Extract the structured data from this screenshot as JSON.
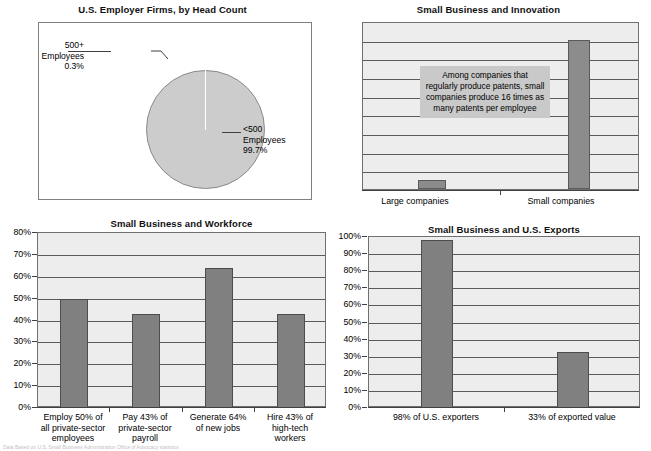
{
  "figure": {
    "footnote": "Data Based on U.S. Small Business Administration Office of Advocacy statistics"
  },
  "chart_data": [
    {
      "type": "pie",
      "id": "employer-firms-pie",
      "title": "U.S. Employer Firms, by Head Count",
      "labels": [
        "<500 Employees",
        "500+ Employees"
      ],
      "values": [
        99.7,
        0.3
      ],
      "value_labels": [
        "99.7%",
        "0.3%"
      ],
      "annotations": [
        {
          "name": "large-firms",
          "line1": "500+",
          "line2": "Employees",
          "line3": "0.3%"
        },
        {
          "name": "small-firms",
          "line1": "<500",
          "line2": "Employees",
          "line3": "99.7%"
        }
      ],
      "slice_color": "#cccccc",
      "legend": "none"
    },
    {
      "type": "bar",
      "id": "innovation-bar",
      "title": "Small Business and Innovation",
      "categories": [
        "Large companies",
        "Small companies"
      ],
      "values": [
        1,
        16
      ],
      "ylim": [
        0,
        18
      ],
      "xlabel": "",
      "ylabel": "",
      "ticks_visible": false,
      "grid": true,
      "bar_color": "#8c8c8c",
      "plot_bg": "#ededed",
      "callout": "Among companies that regularly produce patents, small companies produce 16 times as many patents per employee",
      "callout_bg": "#c9c9c9"
    },
    {
      "type": "bar",
      "id": "workforce-bar",
      "title": "Small Business and Workforce",
      "categories": [
        "Employy 50% of all private-sector employees",
        "Pay 43% of private-sector payroll",
        "Generate 64% of new jobs",
        "Hire 43% of high-tech workers"
      ],
      "category_lines": [
        [
          "Employ 50% of",
          "all private-sector",
          "employees"
        ],
        [
          "Pay 43% of",
          "private-sector",
          "payroll"
        ],
        [
          "Generate 64%",
          "of new jobs"
        ],
        [
          "Hire 43% of",
          "high-tech",
          "workers"
        ]
      ],
      "values": [
        50,
        43,
        64,
        43
      ],
      "ylim": [
        0,
        80
      ],
      "yticks": [
        "0%",
        "10%",
        "20%",
        "30%",
        "40%",
        "50%",
        "60%",
        "70%",
        "80%"
      ],
      "ytick_values": [
        0,
        10,
        20,
        30,
        40,
        50,
        60,
        70,
        80
      ],
      "xlabel": "",
      "ylabel": "",
      "grid": true,
      "bar_color": "#808080",
      "plot_bg": "#ededed"
    },
    {
      "type": "bar",
      "id": "exports-bar",
      "title": "Small Business and U.S. Exports",
      "categories": [
        "98% of U.S. exporters",
        "33% of exported value"
      ],
      "category_lines": [
        [
          "98% of U.S. exporters"
        ],
        [
          "33% of exported value"
        ]
      ],
      "values": [
        98,
        33
      ],
      "ylim": [
        0,
        100
      ],
      "yticks": [
        "0%",
        "10%",
        "20%",
        "30%",
        "40%",
        "50%",
        "60%",
        "70%",
        "80%",
        "90%",
        "100%"
      ],
      "ytick_values": [
        0,
        10,
        20,
        30,
        40,
        50,
        60,
        70,
        80,
        90,
        100
      ],
      "xlabel": "",
      "ylabel": "",
      "grid": true,
      "bar_color": "#808080",
      "plot_bg": "#ededed"
    }
  ]
}
